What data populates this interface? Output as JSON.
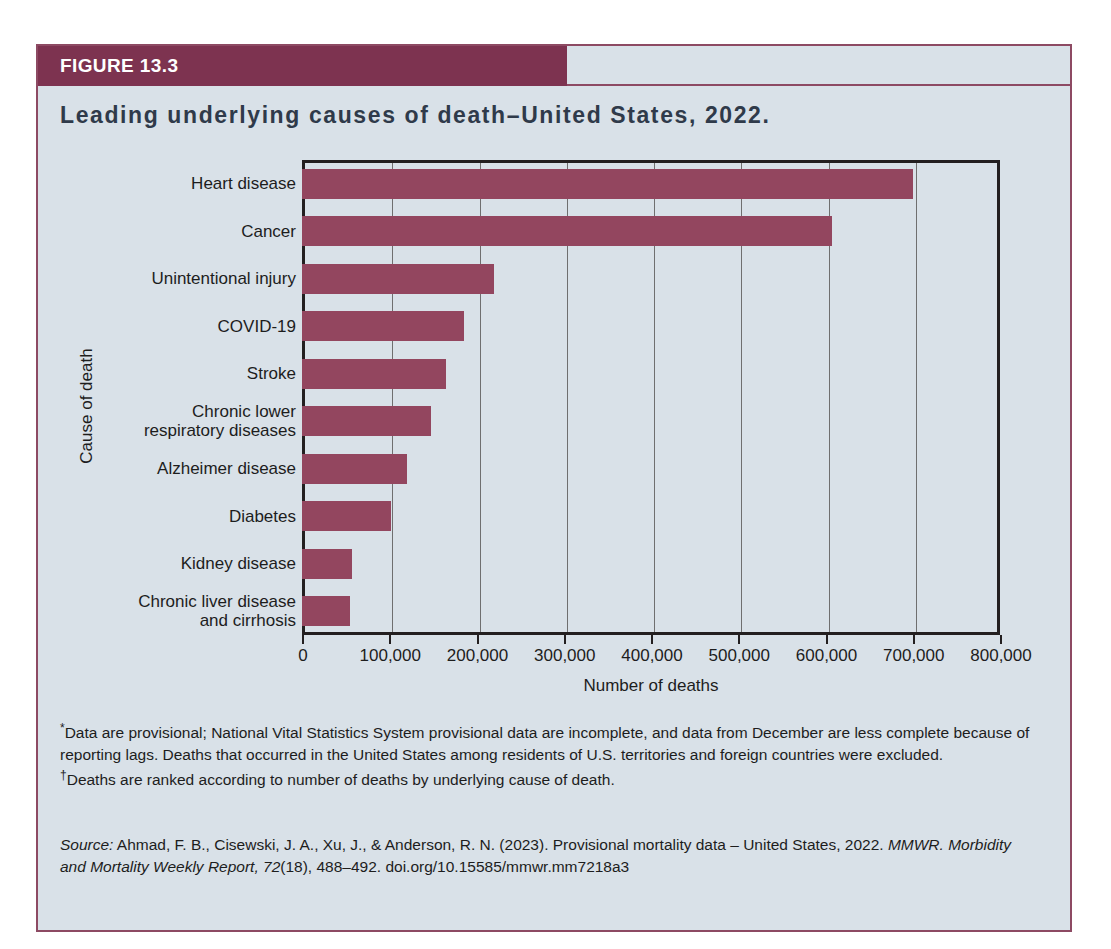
{
  "figure": {
    "header_label": "FIGURE 13.3",
    "title": "Leading underlying causes of death–United States, 2022.",
    "note1_marker": "*",
    "note1": "Data are provisional; National Vital Statistics System provisional data are incomplete, and data from December are less complete because of reporting lags. Deaths that occurred in the United States among residents of U.S. territories and foreign countries were excluded.",
    "note2_marker": "†",
    "note2": "Deaths are ranked according to number of deaths by underlying cause of death.",
    "source_label": "Source:",
    "source_text_a": " Ahmad, F. B., Cisewski, J. A., Xu, J., & Anderson, R. N. (2023). Provisional mortality data – United States, 2022. ",
    "source_journal": "MMWR. Morbidity and Mortality Weekly Report, 72",
    "source_text_b": "(18), 488–492. doi.org/10.15585/mmwr.mm7218a3"
  },
  "colors": {
    "bar": "#93465f",
    "header_band": "#7d3350",
    "panel_bg": "#d9e1e8",
    "border": "#8d4a63",
    "axis": "#231f20",
    "title_text": "#2f3a4a"
  },
  "chart_data": {
    "type": "bar",
    "orientation": "horizontal",
    "title": "Leading underlying causes of death–United States, 2022.",
    "xlabel": "Number of deaths",
    "ylabel": "Cause of death",
    "xlim": [
      0,
      800000
    ],
    "xticks": [
      0,
      100000,
      200000,
      300000,
      400000,
      500000,
      600000,
      700000,
      800000
    ],
    "xtick_labels": [
      "0",
      "100,000",
      "200,000",
      "300,000",
      "400,000",
      "500,000",
      "600,000",
      "700,000",
      "800,000"
    ],
    "grid": "vertical",
    "legend": "none",
    "categories": [
      "Heart disease",
      "Cancer",
      "Unintentional injury",
      "COVID-19",
      "Stroke",
      "Chronic lower\nrespiratory diseases",
      "Alzheimer disease",
      "Diabetes",
      "Kidney disease",
      "Chronic liver disease\nand cirrhosis"
    ],
    "values": [
      700000,
      608000,
      220000,
      186000,
      165000,
      148000,
      120000,
      102000,
      57000,
      55000
    ]
  }
}
